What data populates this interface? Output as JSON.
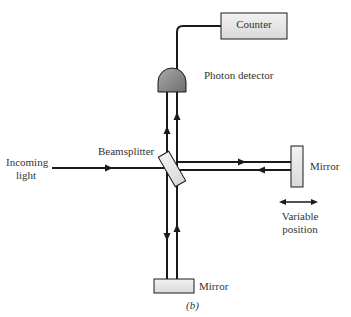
{
  "diagram": {
    "type": "Michelson interferometer",
    "caption": "(b)",
    "labels": {
      "counter": "Counter",
      "photon_detector": "Photon detector",
      "beamsplitter": "Beamsplitter",
      "incoming_light_line1": "Incoming",
      "incoming_light_line2": "light",
      "mirror_right": "Mirror",
      "mirror_bottom": "Mirror",
      "variable_position_line1": "Variable",
      "variable_position_line2": "position"
    },
    "colors": {
      "line": "#1a1a1a",
      "component_fill": "#e6e6e6",
      "detector_fill": "#8c8c8c",
      "background": "#ffffff"
    }
  }
}
